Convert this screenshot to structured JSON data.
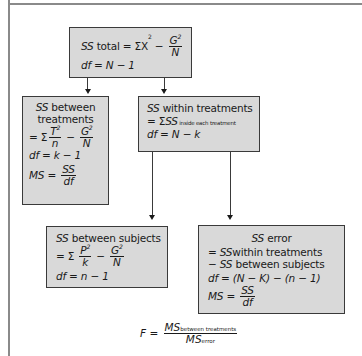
{
  "diagram": {
    "total_box": {
      "ss_label": "SS",
      "title": " total = ΣX",
      "sup": "2",
      "minus": " − ",
      "frac_num": "G",
      "frac_num_sup": "2",
      "frac_den": "N",
      "df": "df = N − 1"
    },
    "between_treatments_box": {
      "ss_label": "SS",
      "title_line1": " between",
      "title_line2": "treatments",
      "eq_prefix": "= Σ",
      "frac1_num": "T",
      "frac1_num_sup": "2",
      "frac1_den": "n",
      "minus": " − ",
      "frac2_num": "G",
      "frac2_num_sup": "2",
      "frac2_den": "N",
      "df": "df = k − 1",
      "ms_prefix": "MS = ",
      "ms_num": "SS",
      "ms_den": "df"
    },
    "within_treatments_box": {
      "ss_label": "SS",
      "title": " within treatments",
      "eq_prefix": "= Σ",
      "eq_ss": "SS",
      "eq_sub": " inside  each treatment",
      "df": "df = N − k"
    },
    "between_subjects_box": {
      "ss_label": "SS",
      "title": " between subjects",
      "eq_prefix": "= Σ ",
      "frac1_num": "P",
      "frac1_num_sup": "2",
      "frac1_den": "k",
      "minus": " − ",
      "frac2_num": "G",
      "frac2_num_sup": "2",
      "frac2_den": "N",
      "df": "df = n − 1"
    },
    "error_box": {
      "ss_label": "SS",
      "title": " error",
      "line1_prefix": "= ",
      "line1_ss": "SS",
      "line1_rest": "within treatments",
      "line2_prefix": "− ",
      "line2_ss": "SS",
      "line2_rest": " between subjects",
      "df": "df = (N − K) − (n − 1)",
      "ms_prefix": "MS = ",
      "ms_num": "SS",
      "ms_den": "df"
    },
    "f_ratio": {
      "lhs": "F = ",
      "num_ms": "MS",
      "num_sub": "between treatments",
      "den_ms": "MS",
      "den_sub": "error"
    }
  }
}
